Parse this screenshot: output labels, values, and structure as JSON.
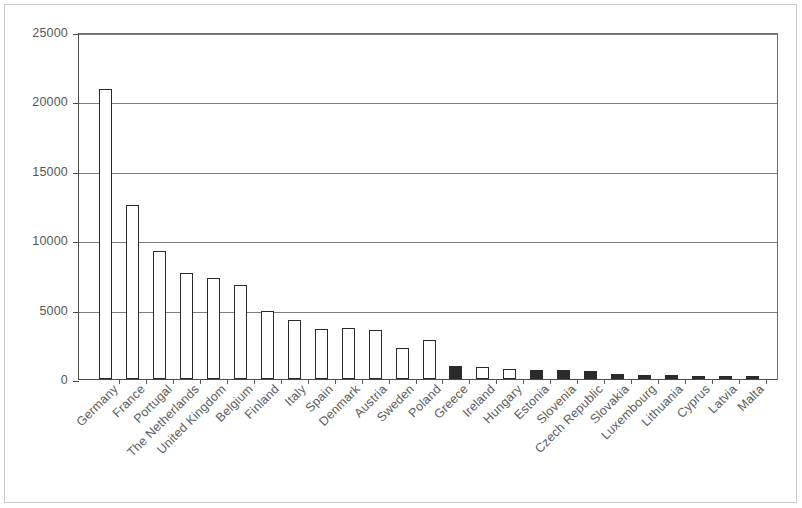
{
  "chart_data": {
    "type": "bar",
    "title": "",
    "subtitle": "",
    "xlabel": "",
    "ylabel": "",
    "ylim": [
      0,
      25000
    ],
    "ytick_labels": [
      "0",
      "5000",
      "10000",
      "15000",
      "20000",
      "25000"
    ],
    "ytick_values": [
      0,
      5000,
      10000,
      15000,
      20000,
      25000
    ],
    "grid": true,
    "legend": "none",
    "categories": [
      "Germany",
      "France",
      "Portugal",
      "The Netherlands",
      "United Kingdom",
      "Belgium",
      "Finland",
      "Italy",
      "Spain",
      "Denmark",
      "Austria",
      "Sweden",
      "Poland",
      "Greece",
      "Ireland",
      "Hungary",
      "Estonia",
      "Slovenia",
      "Czech Republic",
      "Slovakia",
      "Luxembourg",
      "Lithuania",
      "Cyprus",
      "Latvia",
      "Malta"
    ],
    "values": [
      20900,
      12550,
      9250,
      7650,
      7300,
      6800,
      4900,
      4250,
      3600,
      3700,
      3550,
      2250,
      2800,
      950,
      850,
      750,
      650,
      620,
      600,
      330,
      300,
      300,
      250,
      220,
      200
    ],
    "bar_styles": [
      "open",
      "open",
      "open",
      "open",
      "open",
      "open",
      "open",
      "open",
      "open",
      "open",
      "open",
      "open",
      "open",
      "filled",
      "open",
      "open",
      "filled",
      "filled",
      "filled",
      "filled",
      "filled",
      "filled",
      "filled",
      "filled",
      "filled"
    ],
    "colors": {
      "open_fill": "#ffffff",
      "filled_fill": "#2b2b2b",
      "bar_outline": "#2b2b2b",
      "gridline": "#7d7d7d",
      "axis": "#4a4a4a",
      "tick_text": "#555555",
      "label_text": "#5b5b5b",
      "background": "#ffffff"
    }
  }
}
